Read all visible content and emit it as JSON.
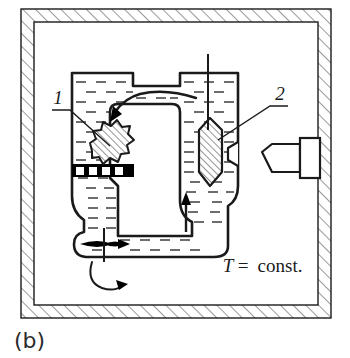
{
  "figure": {
    "panel_label": "(b)",
    "condition_variable": "T",
    "condition_equals": "=",
    "condition_value": "const.",
    "callouts": [
      {
        "id": "callout-1",
        "label": "1",
        "points_to": "perforated-plate-body"
      },
      {
        "id": "callout-2",
        "label": "2",
        "points_to": "right-plug-body"
      }
    ],
    "colors": {
      "line": "#1a1a1a",
      "hatch": "#4a4a4a",
      "fill_white": "#ffffff",
      "liquid_dash": "#3c3c3c",
      "solid_black": "#000000",
      "background": "#ffffff"
    },
    "elements": {
      "outer_enclosure": "hatched-thermostat-wall",
      "vessel": "u-tube-vessel",
      "left_chamber": "left-liquid-column",
      "right_chamber": "right-liquid-column",
      "perforated_plate": "grate-with-openings",
      "left_plug": "irregular-hatched-body",
      "right_plug": "hexagonal-hatched-plug",
      "nozzle": "external-nozzle-assembly",
      "top_rod": "vertical-rod",
      "flow_arrow_top": "curved-flow-arrow-left",
      "flow_arrow_right": "up-flow-arrow",
      "shaft_arrow": "horizontal-shaft-arrow",
      "rotation_arrow": "curved-rotation-arrow"
    }
  }
}
